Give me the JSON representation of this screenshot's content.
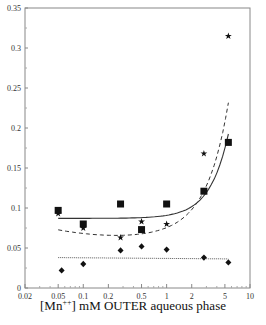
{
  "chart_data": {
    "type": "scatter",
    "title": "",
    "xlabel": "[Mn++] mM OUTER aqueous phase",
    "xlabel_parts": {
      "prefix": "[Mn",
      "sup": "++",
      "suffix": "] mM OUTER aqueous phase"
    },
    "ylabel": "",
    "xscale": "log",
    "xlim": [
      0.02,
      10
    ],
    "ylim": [
      0,
      0.35
    ],
    "x_ticks": [
      "0.02",
      "0.05",
      "0.1",
      "0.2",
      "0.5",
      "1",
      "2",
      "5",
      "10"
    ],
    "y_ticks": [
      "0",
      "0.05",
      "0.1",
      "0.15",
      "0.2",
      "0.25",
      "0.3",
      "0.35"
    ],
    "grid": false,
    "legend": null,
    "series": [
      {
        "name": "squares",
        "marker": "square",
        "fit": "solid",
        "x": [
          0.05,
          0.1,
          0.28,
          0.5,
          1.0,
          2.8,
          5.5
        ],
        "y": [
          0.097,
          0.08,
          0.105,
          0.073,
          0.105,
          0.121,
          0.182
        ]
      },
      {
        "name": "stars",
        "marker": "star",
        "fit": "dashed",
        "x": [
          0.05,
          0.1,
          0.28,
          0.5,
          1.0,
          2.8,
          5.5
        ],
        "y": [
          0.093,
          0.075,
          0.063,
          0.083,
          0.08,
          0.168,
          0.315
        ]
      },
      {
        "name": "diamonds",
        "marker": "diamond",
        "fit": "dotted",
        "x": [
          0.055,
          0.1,
          0.28,
          0.5,
          1.0,
          2.8,
          5.5
        ],
        "y": [
          0.022,
          0.03,
          0.047,
          0.052,
          0.048,
          0.038,
          0.032
        ]
      }
    ]
  }
}
